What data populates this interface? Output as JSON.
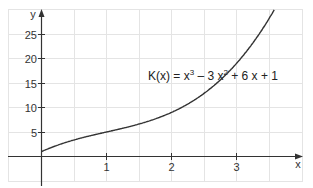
{
  "chart_data": {
    "type": "line",
    "title": "",
    "annotation": "K(x) = x³ − 3x² + 6x + 1",
    "function": "K(x) = x^3 - 3x^2 + 6x + 1",
    "xlabel": "x",
    "ylabel": "y",
    "xlim": [
      -1,
      4
    ],
    "ylim": [
      -5,
      30
    ],
    "x_ticks": [
      1,
      2,
      3
    ],
    "y_ticks": [
      5,
      10,
      15,
      20,
      25
    ],
    "grid": true,
    "grid_step_x": 0.5,
    "grid_step_y": 5,
    "series": [
      {
        "name": "K(x)",
        "x": [
          0,
          0.5,
          1,
          1.5,
          2,
          2.5,
          3,
          3.5,
          3.67
        ],
        "values": [
          1,
          3.375,
          5,
          6.625,
          9,
          12.875,
          19,
          27.125,
          30
        ]
      }
    ],
    "colors": {
      "curve": "#333333",
      "axis": "#333333",
      "grid": "#e4e4e4"
    }
  },
  "labels": {
    "y_axis": "y",
    "x_axis": "x",
    "equation_prefix": "K(x) = x",
    "equation_mid1": " – 3 x",
    "equation_mid2": " + 6 x + 1",
    "sup3": "3",
    "sup2": "2",
    "x_ticks": [
      "1",
      "2",
      "3"
    ],
    "y_ticks": [
      "25",
      "20",
      "15",
      "10",
      "5"
    ]
  }
}
